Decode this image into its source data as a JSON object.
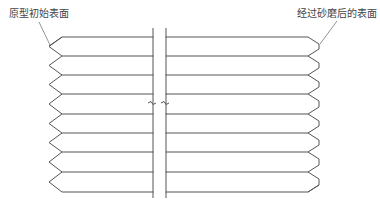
{
  "diagram": {
    "title": "",
    "labels": {
      "left": "原型初始表面",
      "right": "经过砂磨后的表面"
    },
    "colors": {
      "line": "#555555",
      "background": "#ffffff",
      "text": "#444444"
    },
    "layers": {
      "count": 9,
      "y_positions": [
        37,
        56,
        75,
        94,
        114,
        133,
        152,
        172,
        192
      ],
      "left_edge": {
        "profile": "sharp-zigzag",
        "inner_x": 62,
        "tip_x": 49
      },
      "right_edge": {
        "profile": "chamfered (sanded)",
        "inner_x": 308,
        "outer_x": 319
      },
      "line_start_x": 62,
      "line_end_x": 308
    },
    "break": {
      "x_left": 153,
      "x_right": 166,
      "y_top": 28,
      "y_bottom": 198,
      "mark_y": 104
    }
  }
}
